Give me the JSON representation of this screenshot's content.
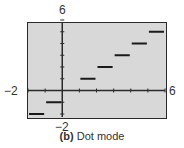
{
  "chart_data": {
    "type": "line",
    "mode": "dot",
    "title": "",
    "xlabel": "",
    "ylabel": "",
    "xlim": [
      -2,
      6
    ],
    "ylim": [
      -2,
      6
    ],
    "grid": false,
    "function": "y = int(x)",
    "segments": [
      {
        "x_start": -2,
        "x_end": -1,
        "y": -2
      },
      {
        "x_start": -1,
        "x_end": 0,
        "y": -1
      },
      {
        "x_start": 0,
        "x_end": 1,
        "y": 0
      },
      {
        "x_start": 1,
        "x_end": 2,
        "y": 1
      },
      {
        "x_start": 2,
        "x_end": 3,
        "y": 2
      },
      {
        "x_start": 3,
        "x_end": 4,
        "y": 3
      },
      {
        "x_start": 4,
        "x_end": 5,
        "y": 4
      },
      {
        "x_start": 5,
        "x_end": 6,
        "y": 5
      }
    ],
    "tick_labels": {
      "xmin": "−2",
      "xmax": "6",
      "ymin": "−2",
      "ymax": "6"
    },
    "colors": {
      "background": "#d8d8d8",
      "frame": "#2a2a2a",
      "line": "#1a1a1a"
    }
  },
  "labels": {
    "ymax": "6",
    "ymin": "−2",
    "xmin": "−2",
    "xmax": "6"
  },
  "caption": {
    "tag": "(b)",
    "text": "Dot mode"
  }
}
